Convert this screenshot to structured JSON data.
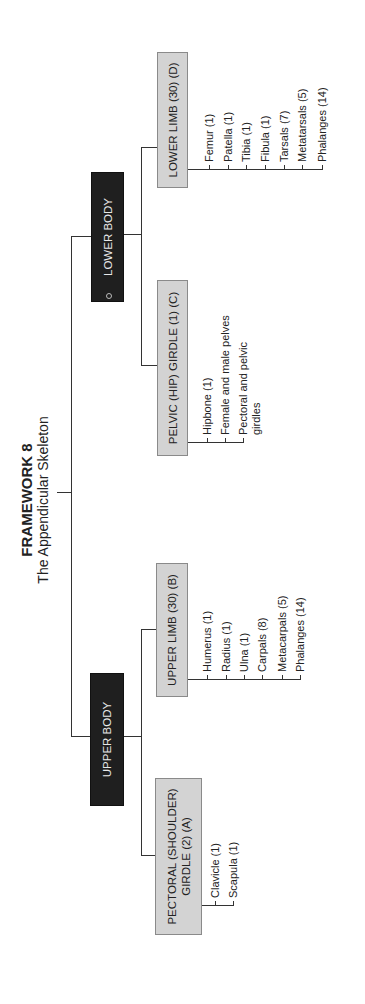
{
  "title": {
    "heading": "FRAMEWORK 8",
    "subtitle": "The Appendicular Skeleton"
  },
  "upper_body": {
    "label": "UPPER BODY",
    "groups": [
      {
        "label": "PECTORAL (SHOULDER) GIRDLE (2) (A)",
        "line1": "PECTORAL (SHOULDER)",
        "line2": "GIRDLE (2) (A)",
        "items": [
          "Clavicle (1)",
          "Scapula (1)"
        ]
      },
      {
        "label": "UPPER LIMB (30) (B)",
        "items": [
          "Humerus (1)",
          "Radius (1)",
          "Ulna (1)",
          "Carpals (8)",
          "Metacarpals (5)",
          "Phalanges (14)"
        ]
      }
    ]
  },
  "lower_body": {
    "label": "LOWER BODY",
    "groups": [
      {
        "label": "PELVIC (HIP) GIRDLE (1) (C)",
        "items": [
          "Hipbone (1)",
          "Female and male pelves",
          "Pectoral and pelvic girdles"
        ]
      },
      {
        "label": "LOWER LIMB (30) (D)",
        "items": [
          "Femur (1)",
          "Patella (1)",
          "Tibia (1)",
          "Fibula (1)",
          "Tarsals (7)",
          "Metatarsals (5)",
          "Phalanges (14)"
        ]
      }
    ]
  },
  "colors": {
    "dark_box": "#1f1f1f",
    "light_box": "#d3d3d3",
    "line": "#333333"
  }
}
